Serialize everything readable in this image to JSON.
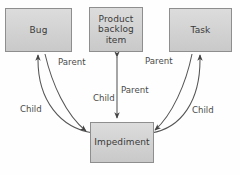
{
  "diagram": {
    "background_color": "#fefefe",
    "node_fill_color": "#d3d3d3",
    "node_border_color": "#8e8e8e",
    "text_color": "#3a3a3a",
    "connector_color": "#555555",
    "nodes": [
      {
        "id": "bug",
        "label": "Bug",
        "x": 5,
        "y": 8,
        "width": 67,
        "height": 44
      },
      {
        "id": "product-backlog-item",
        "label": "Product\nbacklog\nitem",
        "x": 89,
        "y": 7,
        "width": 54,
        "height": 45
      },
      {
        "id": "task",
        "label": "Task",
        "x": 169,
        "y": 8,
        "width": 63,
        "height": 44
      },
      {
        "id": "impediment",
        "label": "Impediment",
        "x": 90,
        "y": 122,
        "width": 64,
        "height": 41
      }
    ],
    "edges": [
      {
        "id": "bug-parent",
        "from": "impediment",
        "to": "bug",
        "label": "Parent",
        "style": "curved",
        "arrow": "end"
      },
      {
        "id": "bug-child",
        "from": "bug",
        "to": "impediment",
        "label": "Child",
        "style": "curved",
        "arrow": "end"
      },
      {
        "id": "pbi-link",
        "from": "product-backlog-item",
        "to": "impediment",
        "label": "Parent",
        "second_label": "Child",
        "style": "straight",
        "arrow": "both"
      },
      {
        "id": "task-parent",
        "from": "impediment",
        "to": "task",
        "label": "Parent",
        "style": "curved",
        "arrow": "end"
      },
      {
        "id": "task-child",
        "from": "task",
        "to": "impediment",
        "label": "Child",
        "style": "curved",
        "arrow": "end"
      }
    ],
    "labels": [
      {
        "id": "label-parent-left",
        "text": "Parent",
        "x": 58,
        "y": 57
      },
      {
        "id": "label-parent-right",
        "text": "Parent",
        "x": 145,
        "y": 56
      },
      {
        "id": "label-parent-middle",
        "text": "Parent",
        "x": 121,
        "y": 85
      },
      {
        "id": "label-child-middle",
        "text": "Child",
        "x": 93,
        "y": 93
      },
      {
        "id": "label-child-left",
        "text": "Child",
        "x": 20,
        "y": 104
      },
      {
        "id": "label-child-right",
        "text": "Child",
        "x": 192,
        "y": 105
      }
    ]
  }
}
